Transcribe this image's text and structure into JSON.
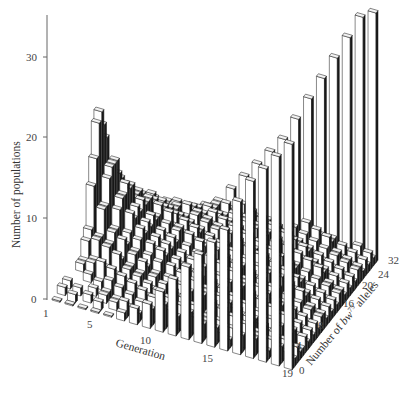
{
  "chart_data": {
    "type": "bar3d",
    "title": "",
    "zlabel": "Number of populations",
    "xlabel": "Generation",
    "ylabel": "Number of bw75 alleles",
    "ylabel_parts": {
      "prefix": "Number of ",
      "gene": "bw",
      "superscript": "75",
      "suffix": " alleles"
    },
    "z_ticks": [
      0,
      10,
      20,
      30
    ],
    "zlim": [
      0,
      34
    ],
    "x_ticks": [
      1,
      5,
      10,
      15,
      19
    ],
    "y_ticks": [
      0,
      4,
      8,
      16,
      20,
      24,
      32
    ],
    "generations": [
      1,
      2,
      3,
      4,
      5,
      6,
      7,
      8,
      9,
      10,
      11,
      12,
      13,
      14,
      15,
      16,
      17,
      18,
      19
    ],
    "allele_bins": [
      0,
      1,
      2,
      3,
      4,
      5,
      6,
      7,
      8,
      9,
      10,
      11,
      12,
      13,
      14,
      15,
      16,
      17,
      18,
      19,
      20,
      21,
      22,
      23,
      24,
      25,
      26,
      27,
      28,
      29,
      30,
      31,
      32
    ],
    "fixed_lost_counts": {
      "lost_0_alleles": [
        0,
        0,
        0,
        0,
        0,
        1,
        2,
        3,
        5,
        7,
        9,
        11,
        13,
        15,
        19,
        22,
        24,
        26,
        28
      ],
      "fixed_32_alleles": [
        0,
        0,
        0,
        0,
        0,
        1,
        2,
        4,
        6,
        8,
        10,
        12,
        15,
        18,
        21,
        24,
        27,
        30,
        31
      ]
    },
    "peak_early": {
      "generation": 6,
      "allele_count": 16,
      "populations": 27
    },
    "grid": false,
    "legend": null
  },
  "axes": {
    "z_tick_labels": [
      "0",
      "10",
      "20",
      "30"
    ],
    "x_tick_labels": [
      "1",
      "5",
      "10",
      "15",
      "19"
    ],
    "y_tick_labels": [
      "0",
      "4",
      "8",
      "16",
      "20",
      "24",
      "32"
    ],
    "z_title": "Number of populations",
    "x_title": "Generation",
    "y_title_prefix": "Number of ",
    "y_title_gene": "bw",
    "y_title_sup": "75",
    "y_title_suffix": " alleles"
  },
  "colors": {
    "bar_face": "#ffffff",
    "bar_side": "#1a1a1a",
    "bar_top": "#f2f2f2",
    "edge": "#111111",
    "axis": "#555555",
    "text": "#444444"
  }
}
